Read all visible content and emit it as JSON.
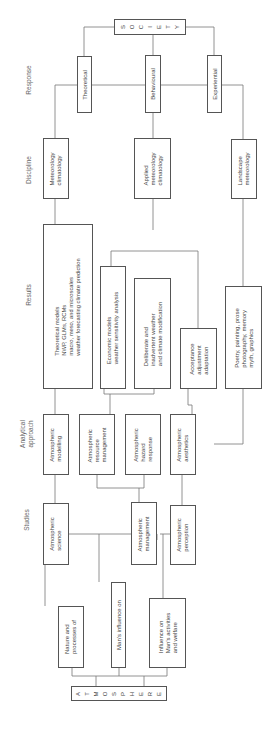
{
  "orientation": "rotated-90-ccw",
  "row_labels": {
    "response": "Response",
    "discipline": "Discipline",
    "results": "Results",
    "analytical_approach": "Analytical\napproach",
    "studies": "Studies"
  },
  "root": {
    "label": "A\nT\nM\nO\nS\nP\nH\nE\nR\nE"
  },
  "top": {
    "label": "S\nO\nC\nI\nE\nT\nY"
  },
  "response": [
    {
      "label": "Theoretical"
    },
    {
      "label": "Behavioural"
    },
    {
      "label": "Experiential"
    }
  ],
  "discipline": [
    {
      "label": "Meteorology\nclimatology"
    },
    {
      "label": "Applied\nmeteorology\nclimatology"
    },
    {
      "label": "Landscape\nmeteorology"
    }
  ],
  "results": [
    {
      "label": "Theoretical models\nNWP, GLMs, RCMs\nmacro, meso, and microscales\nweather forecasting climate prediction"
    },
    {
      "label": "Economic models\nweather sensitivity analysis"
    },
    {
      "label": "Deliberate and\ninadvertent weather\nand climate modification"
    },
    {
      "label": "Acceptance\nadjustment\nadaptation"
    },
    {
      "label": "Poetry, painting, prose\nphotography, memory\nmyth, graphics"
    }
  ],
  "analytical_approach": [
    {
      "label": "Atmospheric\nmodelling"
    },
    {
      "label": "Atmospheric\nresource\nmanagement"
    },
    {
      "label": "Atmospheric\nhazard\nresponse"
    },
    {
      "label": "Atmospheric\naesthetics"
    }
  ],
  "studies": [
    {
      "label": "Atmospheric\nscience"
    },
    {
      "label": "Atmospheric\nmanagement"
    },
    {
      "label": "Atmospheric\nperception"
    }
  ],
  "foundations": [
    {
      "label": "Nature and\nprocesses of"
    },
    {
      "label": "Man's influence on"
    },
    {
      "label": "Influence on\nMan's activities\nand welfare"
    }
  ],
  "colors": {
    "line": "#777777",
    "box_border": "#555555",
    "text": "#444444",
    "label": "#666666"
  }
}
